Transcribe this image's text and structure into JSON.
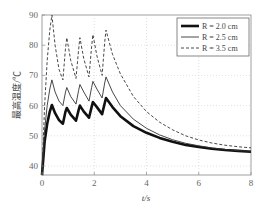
{
  "chart_data": {
    "type": "line",
    "title": "",
    "xlabel": "t/s",
    "ylabel": "最高温度/℃",
    "xlim": [
      0,
      8
    ],
    "ylim": [
      37,
      90
    ],
    "xticks": [
      0,
      2,
      4,
      6,
      8
    ],
    "yticks": [
      40,
      50,
      60,
      70,
      80,
      90
    ],
    "grid": true,
    "legend_position": "top-right",
    "series": [
      {
        "name": "R = 2.0 cm",
        "style": "thick-solid",
        "color": "#111111",
        "points": [
          [
            0,
            37
          ],
          [
            0.1,
            48
          ],
          [
            0.2,
            54
          ],
          [
            0.3,
            58
          ],
          [
            0.38,
            60.2
          ],
          [
            0.5,
            57.5
          ],
          [
            0.65,
            55.2
          ],
          [
            0.8,
            54
          ],
          [
            0.9,
            58
          ],
          [
            0.95,
            59.2
          ],
          [
            1.1,
            57
          ],
          [
            1.3,
            55
          ],
          [
            1.4,
            58.5
          ],
          [
            1.45,
            60
          ],
          [
            1.6,
            58
          ],
          [
            1.8,
            56
          ],
          [
            1.9,
            59.5
          ],
          [
            1.95,
            61.2
          ],
          [
            2.1,
            59.5
          ],
          [
            2.3,
            57.2
          ],
          [
            2.4,
            60.8
          ],
          [
            2.45,
            62.5
          ],
          [
            2.7,
            59.5
          ],
          [
            3.0,
            56.5
          ],
          [
            3.5,
            53.2
          ],
          [
            4.0,
            51
          ],
          [
            4.5,
            49.3
          ],
          [
            5.0,
            48
          ],
          [
            5.5,
            47
          ],
          [
            6.0,
            46.3
          ],
          [
            6.5,
            45.7
          ],
          [
            7.0,
            45.3
          ],
          [
            7.5,
            45
          ],
          [
            8.0,
            44.7
          ]
        ]
      },
      {
        "name": "R = 2.5 cm",
        "style": "thin-solid",
        "color": "#333333",
        "points": [
          [
            0,
            37
          ],
          [
            0.1,
            52
          ],
          [
            0.2,
            60
          ],
          [
            0.3,
            65.5
          ],
          [
            0.38,
            68.5
          ],
          [
            0.5,
            64.5
          ],
          [
            0.65,
            61.5
          ],
          [
            0.8,
            60
          ],
          [
            0.9,
            64.5
          ],
          [
            0.95,
            66
          ],
          [
            1.1,
            63
          ],
          [
            1.3,
            60.5
          ],
          [
            1.4,
            65
          ],
          [
            1.45,
            67
          ],
          [
            1.6,
            64.5
          ],
          [
            1.8,
            61.5
          ],
          [
            1.9,
            66
          ],
          [
            1.95,
            68
          ],
          [
            2.1,
            65.5
          ],
          [
            2.3,
            62.5
          ],
          [
            2.4,
            67.5
          ],
          [
            2.45,
            69.5
          ],
          [
            2.7,
            64.5
          ],
          [
            3.0,
            60
          ],
          [
            3.5,
            55.5
          ],
          [
            4.0,
            52.5
          ],
          [
            4.5,
            50.3
          ],
          [
            5.0,
            48.7
          ],
          [
            5.5,
            47.5
          ],
          [
            6.0,
            46.7
          ],
          [
            6.5,
            46
          ],
          [
            7.0,
            45.5
          ],
          [
            7.5,
            45.1
          ],
          [
            8.0,
            44.9
          ]
        ]
      },
      {
        "name": "R = 3.5 cm",
        "style": "dashed",
        "color": "#333333",
        "points": [
          [
            0,
            37
          ],
          [
            0.1,
            60
          ],
          [
            0.2,
            75
          ],
          [
            0.3,
            85
          ],
          [
            0.38,
            90
          ],
          [
            0.5,
            80
          ],
          [
            0.65,
            72
          ],
          [
            0.8,
            68.5
          ],
          [
            0.9,
            79
          ],
          [
            0.95,
            82.5
          ],
          [
            1.1,
            75
          ],
          [
            1.3,
            69
          ],
          [
            1.4,
            78.5
          ],
          [
            1.45,
            82.5
          ],
          [
            1.6,
            75.5
          ],
          [
            1.8,
            69.5
          ],
          [
            1.9,
            79.5
          ],
          [
            1.95,
            83.5
          ],
          [
            2.1,
            76.5
          ],
          [
            2.3,
            70
          ],
          [
            2.4,
            81
          ],
          [
            2.45,
            85
          ],
          [
            2.7,
            77
          ],
          [
            3.0,
            70.5
          ],
          [
            3.5,
            63
          ],
          [
            4.0,
            58
          ],
          [
            4.5,
            54.5
          ],
          [
            5.0,
            52
          ],
          [
            5.5,
            50
          ],
          [
            6.0,
            48.6
          ],
          [
            6.5,
            47.6
          ],
          [
            7.0,
            46.9
          ],
          [
            7.5,
            46.4
          ],
          [
            8.0,
            46
          ]
        ]
      }
    ]
  }
}
